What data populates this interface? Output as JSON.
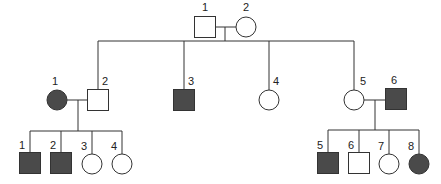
{
  "colors": {
    "affected": "#4a4a4a",
    "unaffected": "#ffffff",
    "stroke": "#333333"
  },
  "legend": {
    "square": "male",
    "circle": "female",
    "filled": "affected",
    "open": "unaffected"
  },
  "generations": [
    {
      "id": "I",
      "individuals": [
        {
          "label": "1",
          "sex": "male",
          "affected": false,
          "cx": 205,
          "cy": 27
        },
        {
          "label": "2",
          "sex": "female",
          "affected": false,
          "cx": 246,
          "cy": 27
        }
      ]
    },
    {
      "id": "II",
      "individuals": [
        {
          "label": "1",
          "sex": "female",
          "affected": true,
          "cx": 57,
          "cy": 100
        },
        {
          "label": "2",
          "sex": "male",
          "affected": false,
          "cx": 98,
          "cy": 100
        },
        {
          "label": "3",
          "sex": "male",
          "affected": true,
          "cx": 184,
          "cy": 100
        },
        {
          "label": "4",
          "sex": "female",
          "affected": false,
          "cx": 269,
          "cy": 100
        },
        {
          "label": "5",
          "sex": "female",
          "affected": false,
          "cx": 354,
          "cy": 100
        },
        {
          "label": "6",
          "sex": "male",
          "affected": true,
          "cx": 396,
          "cy": 99
        }
      ]
    },
    {
      "id": "III",
      "individuals": [
        {
          "label": "1",
          "sex": "male",
          "affected": true,
          "cx": 30,
          "cy": 163
        },
        {
          "label": "2",
          "sex": "male",
          "affected": true,
          "cx": 61,
          "cy": 163
        },
        {
          "label": "3",
          "sex": "female",
          "affected": false,
          "cx": 92,
          "cy": 164
        },
        {
          "label": "4",
          "sex": "female",
          "affected": false,
          "cx": 122,
          "cy": 164
        },
        {
          "label": "5",
          "sex": "male",
          "affected": true,
          "cx": 328,
          "cy": 163
        },
        {
          "label": "6",
          "sex": "male",
          "affected": false,
          "cx": 359,
          "cy": 163
        },
        {
          "label": "7",
          "sex": "female",
          "affected": false,
          "cx": 389,
          "cy": 164
        },
        {
          "label": "8",
          "sex": "female",
          "affected": true,
          "cx": 419,
          "cy": 164
        }
      ]
    }
  ]
}
